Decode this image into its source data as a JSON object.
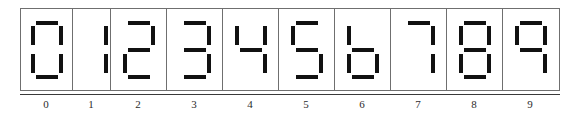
{
  "figure": {
    "segment_color": "#111111",
    "frame_color": "#6f6f6f",
    "axis_color": "#3a3a3a",
    "background": "#ffffff"
  },
  "segment_names": {
    "a": "top",
    "b": "top-right",
    "c": "bottom-right",
    "d": "bottom",
    "e": "bottom-left",
    "f": "top-left",
    "g": "middle"
  },
  "digits": [
    {
      "label": "0",
      "cell_width": 52,
      "segments": {
        "a": true,
        "b": true,
        "c": true,
        "d": true,
        "e": true,
        "f": true,
        "g": false
      }
    },
    {
      "label": "1",
      "cell_width": 38,
      "segments": {
        "a": false,
        "b": true,
        "c": true,
        "d": false,
        "e": false,
        "f": false,
        "g": false
      }
    },
    {
      "label": "2",
      "cell_width": 56,
      "segments": {
        "a": true,
        "b": true,
        "c": false,
        "d": true,
        "e": true,
        "f": false,
        "g": true
      }
    },
    {
      "label": "3",
      "cell_width": 56,
      "segments": {
        "a": true,
        "b": true,
        "c": true,
        "d": true,
        "e": false,
        "f": false,
        "g": true
      }
    },
    {
      "label": "4",
      "cell_width": 56,
      "segments": {
        "a": false,
        "b": true,
        "c": true,
        "d": false,
        "e": false,
        "f": true,
        "g": true
      }
    },
    {
      "label": "5",
      "cell_width": 56,
      "segments": {
        "a": true,
        "b": false,
        "c": true,
        "d": true,
        "e": false,
        "f": true,
        "g": true
      }
    },
    {
      "label": "6",
      "cell_width": 56,
      "segments": {
        "a": false,
        "b": false,
        "c": true,
        "d": true,
        "e": true,
        "f": true,
        "g": true
      }
    },
    {
      "label": "7",
      "cell_width": 56,
      "segments": {
        "a": true,
        "b": true,
        "c": true,
        "d": false,
        "e": false,
        "f": false,
        "g": false
      }
    },
    {
      "label": "8",
      "cell_width": 56,
      "segments": {
        "a": true,
        "b": true,
        "c": true,
        "d": true,
        "e": true,
        "f": true,
        "g": true
      }
    },
    {
      "label": "9",
      "cell_width": 56,
      "segments": {
        "a": true,
        "b": true,
        "c": true,
        "d": false,
        "e": false,
        "f": true,
        "g": true
      }
    }
  ]
}
